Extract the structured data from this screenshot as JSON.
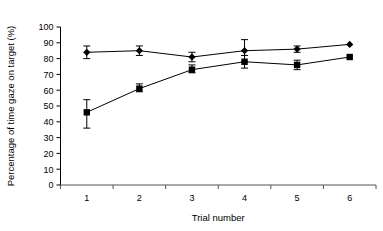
{
  "chart_data": {
    "type": "line",
    "title": "",
    "xlabel": "Trial number",
    "ylabel": "Percentage of time gaze on target (%)",
    "x": [
      1,
      2,
      3,
      4,
      5,
      6
    ],
    "xticklabels": [
      "1",
      "2",
      "3",
      "4",
      "5",
      "6"
    ],
    "yticklabels": [
      "0",
      "10",
      "20",
      "30",
      "40",
      "50",
      "60",
      "70",
      "80",
      "90",
      "100"
    ],
    "yticks": [
      0,
      10,
      20,
      30,
      40,
      50,
      60,
      70,
      80,
      90,
      100
    ],
    "xlim": [
      0.5,
      6.5
    ],
    "ylim": [
      0,
      100
    ],
    "grid": false,
    "legend": "none",
    "errorbars": "SEM",
    "series": [
      {
        "name": "diamond-series",
        "marker": "diamond",
        "color": "#000000",
        "values": [
          84,
          85,
          81,
          85,
          86,
          89
        ],
        "err_low": [
          4,
          3,
          3,
          7,
          2,
          0
        ],
        "err_high": [
          4,
          3,
          3,
          7,
          2,
          0
        ]
      },
      {
        "name": "square-series",
        "marker": "square",
        "color": "#000000",
        "values": [
          46,
          61,
          73,
          78,
          76,
          81
        ],
        "err_low": [
          10,
          2,
          2,
          4,
          3,
          0
        ],
        "err_high": [
          8,
          3,
          3,
          4,
          3,
          0
        ]
      }
    ]
  },
  "colors": {
    "axis": "#000000",
    "line": "#000000",
    "marker": "#000000",
    "background": "#ffffff"
  }
}
